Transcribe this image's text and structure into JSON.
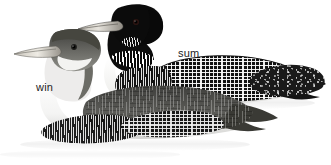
{
  "plate": {
    "title": "Common Loon plumage comparison plate",
    "background_color": "#ffffff",
    "width": 331,
    "height": 165,
    "medium": "field-guide illustration"
  },
  "labels": {
    "summer": {
      "text": "sum",
      "meaning": "summer (breeding) plumage",
      "color": "#1d1d1d",
      "x": 178,
      "y": 48,
      "font_size_px": 11
    },
    "winter": {
      "text": "win",
      "meaning": "winter (non-breeding) plumage",
      "color": "#1d1d1d",
      "x": 36,
      "y": 82,
      "font_size_px": 11
    }
  },
  "birds": [
    {
      "id": "summer-loon",
      "plumage": "summer",
      "label_ref": "sum",
      "pose": "swimming, facing left, rear bird",
      "features": {
        "head_color": "#0d0d0d",
        "bill_color": "#d8d4cc",
        "bill_shape": "straight dagger",
        "eye_color": "#2a1410",
        "neck_band": "white vertical striped collar",
        "back_pattern": "white checkerboard on black",
        "flank_pattern": "fine white barring",
        "breast_color": "#f4f4f2"
      }
    },
    {
      "id": "winter-loon",
      "plumage": "winter",
      "label_ref": "win",
      "pose": "swimming, facing left, front bird",
      "features": {
        "head_color": "#5f5f5c",
        "bill_color": "#e2ded6",
        "bill_shape": "straight dagger",
        "eye_color": "#20201e",
        "throat_color": "#f2f2f0",
        "neck_pattern": "dark crown and hindneck, white throat and foreneck",
        "back_pattern": "plain dark gray-brown with faint scaling",
        "breast_color": "#f7f7f6"
      }
    }
  ],
  "scene": {
    "waterline": true,
    "water_color": "#d6d6d6",
    "reflections": "faint ripples beneath each bird"
  },
  "colors": {
    "ink_black": "#101010",
    "mid_gray": "#6a6a68",
    "pale_gray": "#d9d9d7",
    "paper_white": "#ffffff"
  }
}
